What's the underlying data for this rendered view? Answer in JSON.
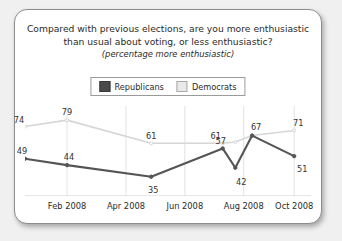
{
  "card": {
    "title_line1": "Compared with previous elections, are you more enthusiastic",
    "title_line2": "than usual about voting, or less enthusiastic?",
    "title_line3": "(percentage more enthusiastic)"
  },
  "legend": {
    "items": [
      {
        "label": "Republicans",
        "color": "#4a4a4a",
        "swatch": "rep"
      },
      {
        "label": "Democrats",
        "color": "#e9e9e9",
        "swatch": "dem"
      }
    ]
  },
  "chart_data": {
    "type": "line",
    "title": "Compared with previous elections, are you more enthusiastic than usual about voting, or less enthusiastic?",
    "subtitle": "(percentage more enthusiastic)",
    "xlabel": "",
    "ylabel": "",
    "ylim": [
      20,
      90
    ],
    "grid": true,
    "legend_position": "top-center",
    "xticks": [
      "Feb 2008",
      "Apr 2008",
      "Jun 2008",
      "Aug 2008",
      "Oct 2008"
    ],
    "x": [
      0.0,
      1.0,
      3.0,
      4.7,
      5.0,
      5.4,
      6.4
    ],
    "series": [
      {
        "name": "Republicans",
        "color": "#555555",
        "values": [
          49,
          44,
          35,
          57,
          42,
          67,
          51
        ],
        "labels": [
          "49",
          "44",
          "35",
          "57",
          "42",
          "67",
          "51"
        ]
      },
      {
        "name": "Democrats",
        "color": "#d6d6d6",
        "values": [
          74,
          79,
          61,
          61,
          62,
          67,
          71
        ],
        "labels": [
          "74",
          "79",
          "61",
          "61",
          "",
          "",
          "71"
        ]
      }
    ]
  }
}
